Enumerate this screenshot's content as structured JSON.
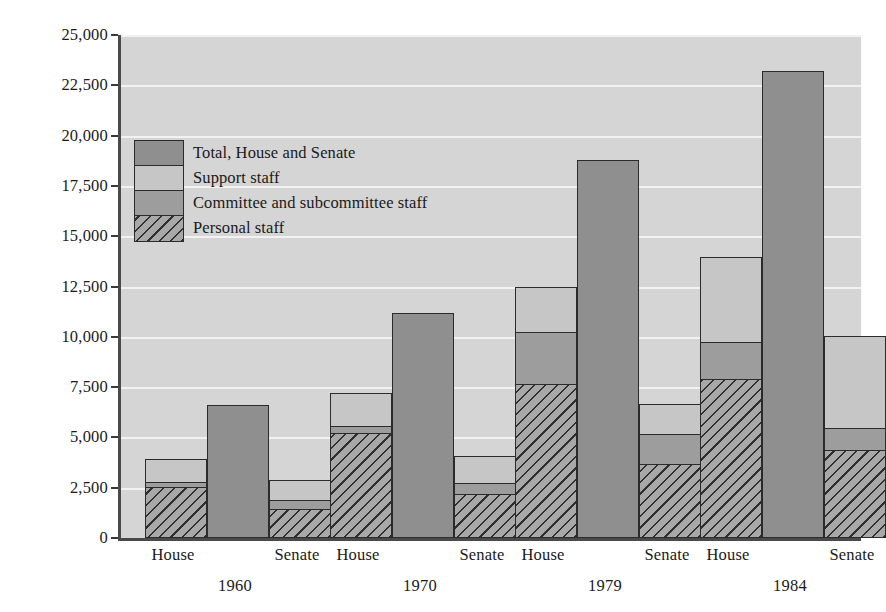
{
  "chart_data": {
    "type": "bar",
    "title": "",
    "subtitle": "",
    "xlabel": "",
    "ylabel": "Number of staffers",
    "ylim": [
      0,
      25000
    ],
    "ytick_labels": [
      "0",
      "2,500",
      "5,000",
      "7,500",
      "10,000",
      "12,500",
      "15,000",
      "17,500",
      "20,000",
      "22,500",
      "25,000"
    ],
    "ytick_values": [
      0,
      2500,
      5000,
      7500,
      10000,
      12500,
      15000,
      17500,
      20000,
      22500,
      25000
    ],
    "grid": true,
    "legend_position": "upper-left",
    "stacked": true,
    "groups": [
      "1960",
      "1970",
      "1979",
      "1984"
    ],
    "chambers": [
      "House",
      "Senate"
    ],
    "series": [
      {
        "name": "Personal staff",
        "key": "personal",
        "color": "#a8a8a8",
        "hatch": "diagonal",
        "values": {
          "1960": {
            "House": 2500,
            "Senate": 1400
          },
          "1970": {
            "House": 5150,
            "Senate": 2150
          },
          "1979": {
            "House": 7600,
            "Senate": 3650
          },
          "1984": {
            "House": 7850,
            "Senate": 4300
          }
        }
      },
      {
        "name": "Committee and subcommittee staff",
        "key": "committee",
        "color": "#9d9d9d",
        "hatch": "none",
        "values": {
          "1960": {
            "House": 250,
            "Senate": 450
          },
          "1970": {
            "House": 350,
            "Senate": 550
          },
          "1979": {
            "House": 2600,
            "Senate": 1450
          },
          "1984": {
            "House": 1850,
            "Senate": 1100
          }
        }
      },
      {
        "name": "Support staff",
        "key": "support",
        "color": "#c6c6c6",
        "hatch": "none",
        "values": {
          "1960": {
            "House": 1100,
            "Senate": 950
          },
          "1970": {
            "House": 1650,
            "Senate": 1300
          },
          "1979": {
            "House": 2200,
            "Senate": 1500
          },
          "1984": {
            "House": 4200,
            "Senate": 4550
          }
        }
      },
      {
        "name": "Total, House and Senate",
        "key": "total",
        "color": "#8f8f8f",
        "hatch": "none",
        "values": {
          "1960": 6600,
          "1970": 11200,
          "1979": 18800,
          "1984": 23200
        }
      }
    ],
    "chamber_totals": {
      "1960": {
        "House": 3850,
        "Senate": 2800
      },
      "1970": {
        "House": 7150,
        "Senate": 4000
      },
      "1979": {
        "House": 12400,
        "Senate": 6600
      },
      "1984": {
        "House": 13900,
        "Senate": 9950
      }
    }
  },
  "axis": {
    "y_title": "Number of staffers",
    "ticks": [
      "25,000",
      "22,500",
      "20,000",
      "17,500",
      "15,000",
      "12,500",
      "10,000",
      "7,500",
      "5,000",
      "2,500",
      "0"
    ]
  },
  "legend": {
    "items": [
      {
        "label": "Total, House and Senate",
        "swatch": "total"
      },
      {
        "label": "Support staff",
        "swatch": "support"
      },
      {
        "label": "Committee and subcommittee staff",
        "swatch": "committee"
      },
      {
        "label": "Personal staff",
        "swatch": "personal"
      }
    ]
  },
  "x_axis": {
    "groups": [
      {
        "year": "1960",
        "chambers": [
          "House",
          "Senate"
        ]
      },
      {
        "year": "1970",
        "chambers": [
          "House",
          "Senate"
        ]
      },
      {
        "year": "1979",
        "chambers": [
          "House",
          "Senate"
        ]
      },
      {
        "year": "1984",
        "chambers": [
          "House",
          "Senate"
        ]
      }
    ]
  },
  "colors": {
    "plot_background": "#d5d5d5",
    "gridline": "#f2f2f2",
    "axis": "#4a4a4a",
    "bar_outline": "#2b2b2b",
    "personal": "#a8a8a8",
    "committee": "#9d9d9d",
    "support": "#c6c6c6",
    "total": "#8f8f8f"
  }
}
